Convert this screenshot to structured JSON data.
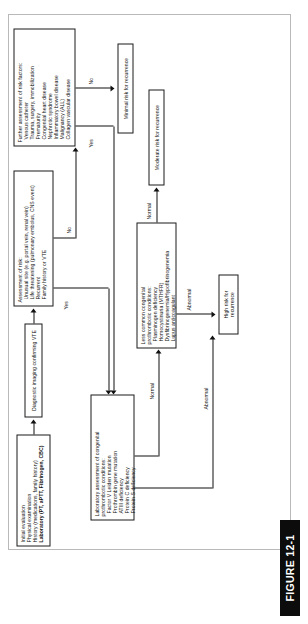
{
  "figure": {
    "caption": "FIGURE 12-1",
    "orientation": "rotated-90-ccw",
    "accent_color": "#0c0c0c",
    "line_color": "#111111",
    "frame_color": "#b9b9b9"
  },
  "nodes": {
    "initial_evaluation": {
      "lines": [
        "Initial evaluation",
        "Physical examination",
        "History (medications, family history)",
        "Laboratory (PT, aPTT, Fibrinogen, CBC)"
      ],
      "bold_line_index": 3
    },
    "diagnostic_imaging": {
      "lines": [
        "Diagnostic imaging confirming VTE"
      ]
    },
    "assessment_of_risk": {
      "title": "Assessment of risk:",
      "items": [
        "Unusual site (e.g. portal vein, renal vein)",
        "Life threatening (pulmonary embolus, CNS event)",
        "Recurrent",
        "Family history or VTE"
      ]
    },
    "further_assessment": {
      "title": "Further assessment of risk factors:",
      "items": [
        "Venous catheter",
        "Trauma, surgery, immobilization",
        "Prematurity",
        "Congenital heart disease",
        "Nephrotic syndrome",
        "Inflammatory bowel disease",
        "Malignancy (ALL)",
        "Collagen vascular disease"
      ]
    },
    "lab_assessment": {
      "title": "Laboratory assessment of congenital",
      "title2": "prothrombotic conditions:",
      "items": [
        "Factor V Leiden mutation",
        "Prothrombin gene mutation",
        "ATIII deficiency",
        "Protein C deficiency",
        "Protein S deficiency"
      ]
    },
    "less_common": {
      "title": "Less common congenital",
      "title2": "prothrombotic conditions:",
      "items": [
        "Plasminogen deficiency",
        "Homocystinuria (MTHFR)",
        "Dysfibrinogenemia/Hypofibrinogenemia",
        "Lupus anticoagulant"
      ]
    },
    "minimal_risk": {
      "label": "Minimal risk for recurrence"
    },
    "moderate_risk": {
      "label": "Moderate risk for recurrence"
    },
    "high_risk": {
      "label_line1": "High risk for",
      "label_line2": "recurrence"
    }
  },
  "edge_labels": {
    "risk_yes": "Yes",
    "risk_no": "No",
    "further_yes": "Yes",
    "further_no": "No",
    "lab_abnormal": "Abnormal",
    "lab_normal": "Normal",
    "less_abnormal": "Abnormal",
    "less_normal": "Normal"
  }
}
